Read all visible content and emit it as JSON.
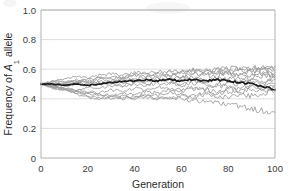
{
  "chart_data": {
    "type": "line",
    "title": "",
    "xlabel": "Generation",
    "ylabel_prefix": "Frequency of ",
    "ylabel_italic": "A",
    "ylabel_sub": "1",
    "ylabel_suffix": " allele",
    "xlim": [
      0,
      100
    ],
    "ylim": [
      0,
      1.0
    ],
    "xticks": [
      0,
      20,
      40,
      60,
      80,
      100
    ],
    "xtick_labels": [
      "0",
      "20",
      "40",
      "60",
      "80",
      "100"
    ],
    "yticks": [
      0,
      0.2,
      0.4,
      0.6,
      0.8,
      1.0
    ],
    "ytick_labels": [
      "0",
      "0.2",
      "0.4",
      "0.6",
      "0.8",
      "1.0"
    ],
    "grid": "horizontal",
    "legend": "none",
    "x": [
      0,
      5,
      10,
      15,
      20,
      25,
      30,
      35,
      40,
      45,
      50,
      55,
      60,
      65,
      70,
      75,
      80,
      85,
      90,
      95,
      100
    ],
    "replicate_color": "#9a9a9a",
    "mean_color": "#1c1c1c",
    "series": [
      {
        "name": "replicate-1",
        "values": [
          0.5,
          0.52,
          0.53,
          0.55,
          0.54,
          0.56,
          0.57,
          0.56,
          0.58,
          0.57,
          0.58,
          0.59,
          0.58,
          0.6,
          0.59,
          0.6,
          0.61,
          0.6,
          0.61,
          0.6,
          0.61
        ]
      },
      {
        "name": "replicate-2",
        "values": [
          0.5,
          0.51,
          0.52,
          0.51,
          0.53,
          0.54,
          0.53,
          0.55,
          0.56,
          0.57,
          0.56,
          0.58,
          0.57,
          0.59,
          0.58,
          0.6,
          0.59,
          0.61,
          0.6,
          0.61,
          0.62
        ]
      },
      {
        "name": "replicate-3",
        "values": [
          0.5,
          0.52,
          0.51,
          0.53,
          0.52,
          0.54,
          0.55,
          0.54,
          0.56,
          0.55,
          0.57,
          0.56,
          0.58,
          0.57,
          0.59,
          0.58,
          0.57,
          0.59,
          0.58,
          0.6,
          0.59
        ]
      },
      {
        "name": "replicate-4",
        "values": [
          0.5,
          0.49,
          0.51,
          0.52,
          0.51,
          0.53,
          0.52,
          0.54,
          0.53,
          0.55,
          0.54,
          0.56,
          0.55,
          0.57,
          0.56,
          0.58,
          0.57,
          0.56,
          0.58,
          0.57,
          0.58
        ]
      },
      {
        "name": "replicate-5",
        "values": [
          0.5,
          0.51,
          0.5,
          0.52,
          0.51,
          0.5,
          0.52,
          0.51,
          0.53,
          0.52,
          0.54,
          0.53,
          0.55,
          0.54,
          0.56,
          0.55,
          0.57,
          0.56,
          0.55,
          0.57,
          0.56
        ]
      },
      {
        "name": "replicate-6",
        "values": [
          0.5,
          0.5,
          0.49,
          0.51,
          0.5,
          0.52,
          0.51,
          0.53,
          0.52,
          0.51,
          0.53,
          0.52,
          0.54,
          0.53,
          0.52,
          0.54,
          0.53,
          0.55,
          0.54,
          0.56,
          0.55
        ]
      },
      {
        "name": "replicate-7",
        "values": [
          0.5,
          0.49,
          0.48,
          0.5,
          0.49,
          0.51,
          0.5,
          0.49,
          0.51,
          0.5,
          0.52,
          0.51,
          0.5,
          0.52,
          0.51,
          0.53,
          0.52,
          0.51,
          0.53,
          0.52,
          0.54
        ]
      },
      {
        "name": "replicate-8",
        "values": [
          0.5,
          0.48,
          0.47,
          0.46,
          0.48,
          0.47,
          0.49,
          0.48,
          0.5,
          0.49,
          0.51,
          0.5,
          0.49,
          0.51,
          0.5,
          0.49,
          0.51,
          0.5,
          0.52,
          0.51,
          0.53
        ]
      },
      {
        "name": "replicate-9",
        "values": [
          0.5,
          0.49,
          0.47,
          0.46,
          0.45,
          0.44,
          0.46,
          0.45,
          0.47,
          0.46,
          0.48,
          0.47,
          0.46,
          0.48,
          0.47,
          0.49,
          0.48,
          0.47,
          0.49,
          0.48,
          0.5
        ]
      },
      {
        "name": "replicate-10",
        "values": [
          0.5,
          0.48,
          0.47,
          0.45,
          0.44,
          0.43,
          0.42,
          0.44,
          0.43,
          0.45,
          0.44,
          0.46,
          0.45,
          0.47,
          0.46,
          0.45,
          0.47,
          0.46,
          0.48,
          0.47,
          0.49
        ]
      },
      {
        "name": "replicate-11",
        "values": [
          0.5,
          0.48,
          0.46,
          0.45,
          0.43,
          0.42,
          0.41,
          0.42,
          0.41,
          0.43,
          0.42,
          0.44,
          0.43,
          0.42,
          0.44,
          0.43,
          0.45,
          0.44,
          0.46,
          0.45,
          0.47
        ]
      },
      {
        "name": "replicate-12",
        "values": [
          0.5,
          0.47,
          0.46,
          0.44,
          0.42,
          0.41,
          0.4,
          0.41,
          0.4,
          0.42,
          0.41,
          0.4,
          0.42,
          0.41,
          0.43,
          0.42,
          0.41,
          0.43,
          0.42,
          0.44,
          0.45
        ]
      },
      {
        "name": "replicate-13",
        "values": [
          0.5,
          0.48,
          0.46,
          0.43,
          0.41,
          0.4,
          0.41,
          0.4,
          0.42,
          0.41,
          0.4,
          0.41,
          0.4,
          0.39,
          0.38,
          0.37,
          0.36,
          0.35,
          0.33,
          0.32,
          0.31
        ]
      },
      {
        "name": "mean",
        "values": [
          0.5,
          0.5,
          0.49,
          0.5,
          0.49,
          0.5,
          0.51,
          0.52,
          0.52,
          0.53,
          0.52,
          0.53,
          0.52,
          0.53,
          0.52,
          0.53,
          0.52,
          0.51,
          0.5,
          0.48,
          0.46
        ]
      }
    ]
  }
}
